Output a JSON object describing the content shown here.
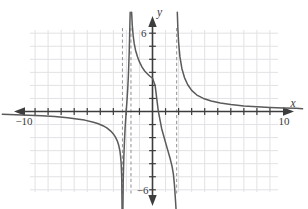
{
  "figure": {
    "kind": "cartesian-graph",
    "background": "#ffffff",
    "axis_color": "#3d3d3d",
    "grid_color": "#e2e2e6",
    "curve_color": "#5a5a5a",
    "asymptote_color": "#9a9a9a"
  },
  "axes": {
    "x_axis_label": "x",
    "y_axis_label": "y",
    "x_ticks_labeled": [
      {
        "value": -10,
        "text": "−10"
      },
      {
        "value": 10,
        "text": "10"
      }
    ],
    "y_ticks_labeled": [
      {
        "value": 6,
        "text": "6"
      },
      {
        "value": -6,
        "text": "−6"
      }
    ],
    "xlim": [
      -11.5,
      11.5
    ],
    "ylim": [
      -7.6,
      7.6
    ],
    "tick_step": 1,
    "grid": true,
    "grid_step": 1,
    "arrows": [
      "left",
      "right",
      "up",
      "down"
    ]
  },
  "chart_data": {
    "type": "line",
    "title": "",
    "xlabel": "x",
    "ylabel": "y",
    "xlim": [
      -11.5,
      11.5
    ],
    "ylim": [
      -7.6,
      7.6
    ],
    "grid": true,
    "legend": "none",
    "annotations": [],
    "vertical_asymptotes": [
      -2.3,
      -1.65,
      1.85
    ],
    "horizontal_asymptote": 0,
    "branches": [
      {
        "name": "left-branch",
        "description": "decreasing branch below x-axis, flat near y=0 at far left, plunging to -infinity at x=-2.3",
        "x": [
          -11.5,
          -10.5,
          -9.5,
          -8.5,
          -7.5,
          -6.5,
          -5.8,
          -5.2,
          -4.6,
          -4.2,
          -3.8,
          -3.5,
          -3.2,
          -3.0,
          -2.85,
          -2.7,
          -2.6,
          -2.5,
          -2.45,
          -2.4,
          -2.36,
          -2.33
        ],
        "y": [
          -0.22,
          -0.25,
          -0.28,
          -0.33,
          -0.39,
          -0.48,
          -0.57,
          -0.66,
          -0.8,
          -0.92,
          -1.09,
          -1.26,
          -1.5,
          -1.72,
          -1.94,
          -2.25,
          -2.55,
          -3.0,
          -3.4,
          -4.0,
          -5.0,
          -7.6
        ]
      },
      {
        "name": "middle-narrow-branch",
        "description": "steep branch confined between asymptotes x=-2.3 and x=-1.65, rising from -infinity to +infinity",
        "x": [
          -2.27,
          -2.24,
          -2.2,
          -2.15,
          -2.1,
          -2.05,
          -2.0,
          -1.95,
          -1.9,
          -1.85,
          -1.82,
          -1.79,
          -1.76,
          -1.73,
          -1.71
        ],
        "y": [
          -7.6,
          -5.2,
          -3.6,
          -2.3,
          -1.3,
          -0.5,
          0.2,
          0.9,
          1.7,
          2.7,
          3.5,
          4.4,
          5.5,
          6.8,
          7.6
        ]
      },
      {
        "name": "center-branch",
        "description": "decreasing branch between asymptotes x=-1.65 and x=1.85, passing through the origin region, crossing y-axis near y=2.6 and x-axis near x=0.45",
        "x": [
          -1.6,
          -1.55,
          -1.48,
          -1.4,
          -1.3,
          -1.15,
          -1.0,
          -0.8,
          -0.6,
          -0.4,
          -0.2,
          0.0,
          0.2,
          0.45,
          0.7,
          0.95,
          1.15,
          1.35,
          1.5,
          1.6,
          1.68,
          1.74,
          1.78,
          1.81
        ],
        "y": [
          7.6,
          6.6,
          5.8,
          5.2,
          4.7,
          4.2,
          3.8,
          3.4,
          3.1,
          2.9,
          2.7,
          2.55,
          2.0,
          0.0,
          -1.3,
          -2.2,
          -2.9,
          -3.6,
          -4.2,
          -4.8,
          -5.6,
          -6.5,
          -7.1,
          -7.6
        ]
      },
      {
        "name": "right-branch",
        "description": "decreasing branch right of asymptote x=1.85, descending from +infinity toward horizontal asymptote y=0",
        "x": [
          1.9,
          1.95,
          2.0,
          2.1,
          2.25,
          2.45,
          2.7,
          3.0,
          3.4,
          3.9,
          4.5,
          5.2,
          6.0,
          7.0,
          8.0,
          9.0,
          10.0,
          11.0,
          11.5
        ],
        "y": [
          7.6,
          6.2,
          5.3,
          4.2,
          3.3,
          2.6,
          2.05,
          1.62,
          1.26,
          1.0,
          0.8,
          0.65,
          0.53,
          0.43,
          0.36,
          0.31,
          0.27,
          0.24,
          0.22
        ]
      }
    ]
  }
}
